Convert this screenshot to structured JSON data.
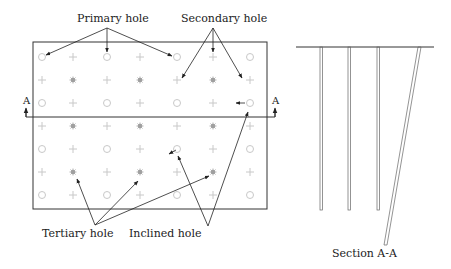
{
  "labels": {
    "primary": "Primary hole",
    "secondary": "Secondary hole",
    "tertiary": "Tertiary hole",
    "inclined": "Inclined hole",
    "section_marker_left": "A",
    "section_marker_right": "A",
    "section_caption": "Section A-A"
  },
  "plan": {
    "columns_x": [
      42,
      73,
      107,
      140,
      177,
      213,
      250
    ],
    "rows_y": [
      57,
      80,
      103,
      126,
      149,
      172,
      195
    ],
    "pattern": [
      [
        "primary",
        "secondary",
        "primary",
        "secondary",
        "primary",
        "secondary",
        "primary"
      ],
      [
        "secondary",
        "tertiary",
        "secondary",
        "tertiary",
        "secondary",
        "tertiary",
        "secondary"
      ],
      [
        "primary",
        "secondary",
        "primary",
        "secondary",
        "primary",
        "secondary",
        "primary"
      ],
      [
        "secondary",
        "tertiary",
        "secondary",
        "tertiary",
        "secondary",
        "tertiary",
        "secondary"
      ],
      [
        "primary",
        "secondary",
        "primary",
        "secondary",
        "primary",
        "secondary",
        "primary"
      ],
      [
        "secondary",
        "tertiary",
        "secondary",
        "tertiary",
        "secondary",
        "tertiary",
        "secondary"
      ],
      [
        "primary",
        "secondary",
        "primary",
        "secondary",
        "primary",
        "secondary",
        "primary"
      ]
    ]
  },
  "colors": {
    "line": "#333333",
    "hole": "#c8c8c8",
    "tertiary": "#a0a0a0"
  }
}
